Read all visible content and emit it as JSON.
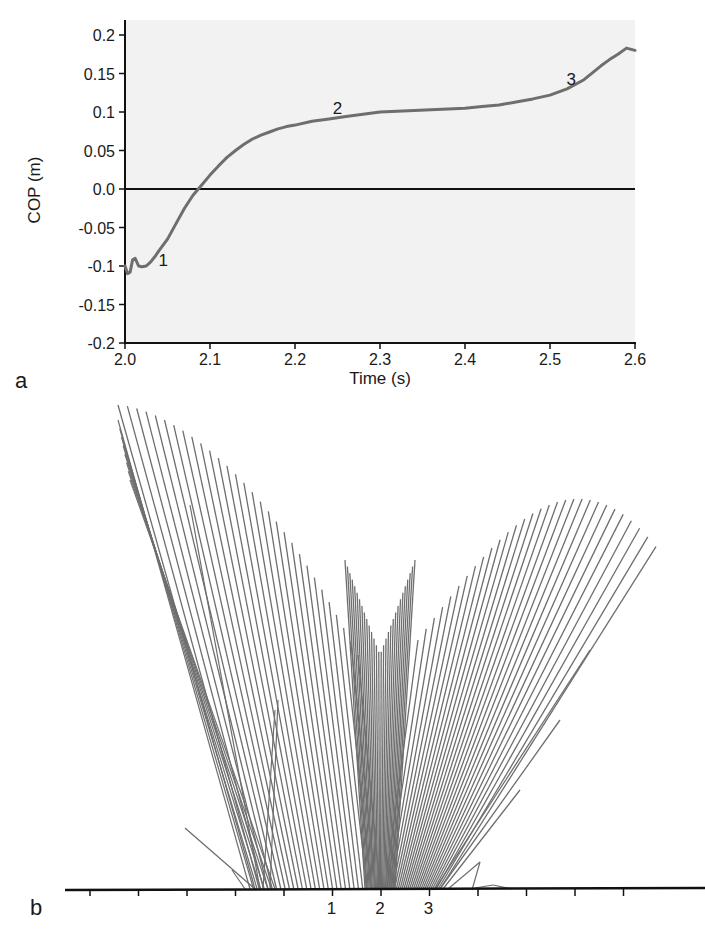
{
  "chart_data": [
    {
      "id": "a",
      "type": "line",
      "panel_label": "a",
      "title": "",
      "xlabel": "Time (s)",
      "ylabel": "COP (m)",
      "xlim": [
        2.0,
        2.6
      ],
      "ylim": [
        -0.2,
        0.2
      ],
      "xticks": [
        2.0,
        2.1,
        2.2,
        2.3,
        2.4,
        2.5,
        2.6
      ],
      "xtick_labels": [
        "2.0",
        "2.1",
        "2.2",
        "2.3",
        "2.4",
        "2.5",
        "2.6"
      ],
      "yticks": [
        0.2,
        0.15,
        0.1,
        0.05,
        0.0,
        -0.05,
        -0.1,
        -0.15,
        -0.2
      ],
      "ytick_labels": [
        "0.2",
        "0.15",
        "0.1",
        "0.05",
        "0.0",
        "-0.05",
        "-0.1",
        "-0.15",
        "-0.2"
      ],
      "zero_line": true,
      "grid": false,
      "background": "#f2f2f2",
      "line_color": "#6e6e6e",
      "series": [
        {
          "name": "COP",
          "x": [
            2.0,
            2.003,
            2.006,
            2.009,
            2.012,
            2.016,
            2.02,
            2.025,
            2.03,
            2.035,
            2.04,
            2.05,
            2.06,
            2.07,
            2.08,
            2.09,
            2.1,
            2.11,
            2.12,
            2.13,
            2.14,
            2.15,
            2.16,
            2.17,
            2.18,
            2.19,
            2.2,
            2.22,
            2.24,
            2.26,
            2.28,
            2.3,
            2.32,
            2.34,
            2.36,
            2.38,
            2.4,
            2.42,
            2.44,
            2.46,
            2.48,
            2.5,
            2.52,
            2.54,
            2.56,
            2.57,
            2.58,
            2.59,
            2.6
          ],
          "y": [
            -0.1,
            -0.11,
            -0.108,
            -0.092,
            -0.09,
            -0.1,
            -0.101,
            -0.1,
            -0.095,
            -0.088,
            -0.08,
            -0.065,
            -0.045,
            -0.025,
            -0.008,
            0.005,
            0.018,
            0.03,
            0.041,
            0.05,
            0.058,
            0.065,
            0.07,
            0.074,
            0.078,
            0.081,
            0.083,
            0.088,
            0.091,
            0.094,
            0.097,
            0.1,
            0.101,
            0.102,
            0.103,
            0.104,
            0.105,
            0.107,
            0.109,
            0.113,
            0.117,
            0.122,
            0.13,
            0.142,
            0.16,
            0.168,
            0.175,
            0.183,
            0.18
          ]
        }
      ],
      "annotations": [
        {
          "text": "1",
          "x": 2.045,
          "y": -0.1
        },
        {
          "text": "2",
          "x": 2.25,
          "y": 0.098
        },
        {
          "text": "3",
          "x": 2.525,
          "y": 0.135
        }
      ]
    },
    {
      "id": "b",
      "type": "line",
      "panel_label": "b",
      "title": "",
      "description": "Stick-figure sequence of segment lines pivoting over a ground line",
      "line_color": "#6e6e6e",
      "ground_tick_count": 12,
      "ground_labels": [
        {
          "text": "1",
          "tick_index": 5
        },
        {
          "text": "2",
          "tick_index": 6
        },
        {
          "text": "3",
          "tick_index": 7
        }
      ],
      "segments_fan": {
        "note": "Lines anchored on ground, tips sweep left-to-right through a V-shaped envelope",
        "left_group_count": 30,
        "center_group_count": 30,
        "right_group_count": 30
      }
    }
  ]
}
